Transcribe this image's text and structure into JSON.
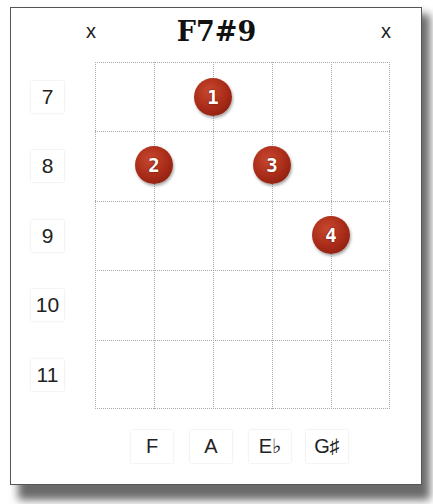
{
  "chord": {
    "name": "F7#9",
    "muted_strings": [
      {
        "string": 6,
        "symbol": "x"
      },
      {
        "string": 1,
        "symbol": "x"
      }
    ]
  },
  "frets": [
    "7",
    "8",
    "9",
    "10",
    "11"
  ],
  "fingers": [
    {
      "finger": "1",
      "string": 3,
      "fret": "7"
    },
    {
      "finger": "2",
      "string": 5,
      "fret": "8"
    },
    {
      "finger": "3",
      "string": 2,
      "fret": "8"
    },
    {
      "finger": "4",
      "string": 1,
      "fret": "9"
    }
  ],
  "notes": [
    "F",
    "A",
    "E♭",
    "G♯"
  ],
  "colors": {
    "dot": "#a62a17",
    "grid": "#aaaaaa"
  }
}
